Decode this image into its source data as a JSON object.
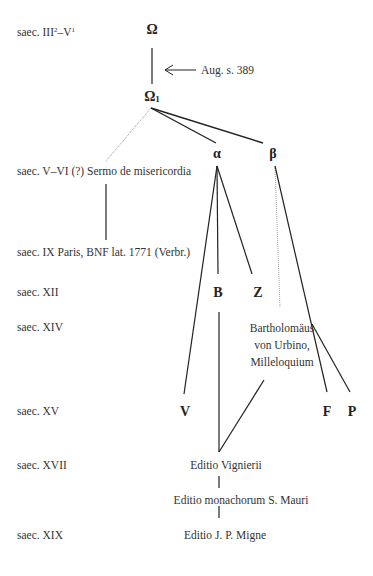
{
  "diagram": {
    "type": "stemma_codicum",
    "eras": [
      {
        "id": "era-iii-v",
        "label_main": "saec. III",
        "sup1": "2",
        "label_mid": "–V",
        "sup2": "1"
      },
      {
        "id": "era-v-vi",
        "label": "saec. V–VI (?) Sermo de misericordia"
      },
      {
        "id": "era-ix",
        "label": "saec. IX  Paris, BNF lat. 1771 (Verbr.)"
      },
      {
        "id": "era-xii",
        "label": "saec. XII"
      },
      {
        "id": "era-xiv",
        "label": "saec. XIV"
      },
      {
        "id": "era-xv",
        "label": "saec. XV"
      },
      {
        "id": "era-xvii",
        "label": "saec. XVII"
      },
      {
        "id": "era-xix",
        "label": "saec. XIX"
      }
    ],
    "nodes": {
      "omega": "Ω",
      "omega1": "Ω",
      "omega1_sub": "1",
      "alpha": "α",
      "beta": "β",
      "B": "B",
      "Z": "Z",
      "V": "V",
      "F": "F",
      "P": "P",
      "aug_source": "Aug. s. 389",
      "bartholomaeus": [
        "Bartholomäus",
        "von Urbino,",
        "Milleloquium"
      ],
      "editio_vignierii": "Editio Vignierii",
      "editio_maurini": "Editio monachorum S. Mauri",
      "editio_migne": "Editio J. P. Migne"
    },
    "colors": {
      "line": "#222222",
      "dotted_line": "#777777",
      "text": "#333333"
    }
  }
}
